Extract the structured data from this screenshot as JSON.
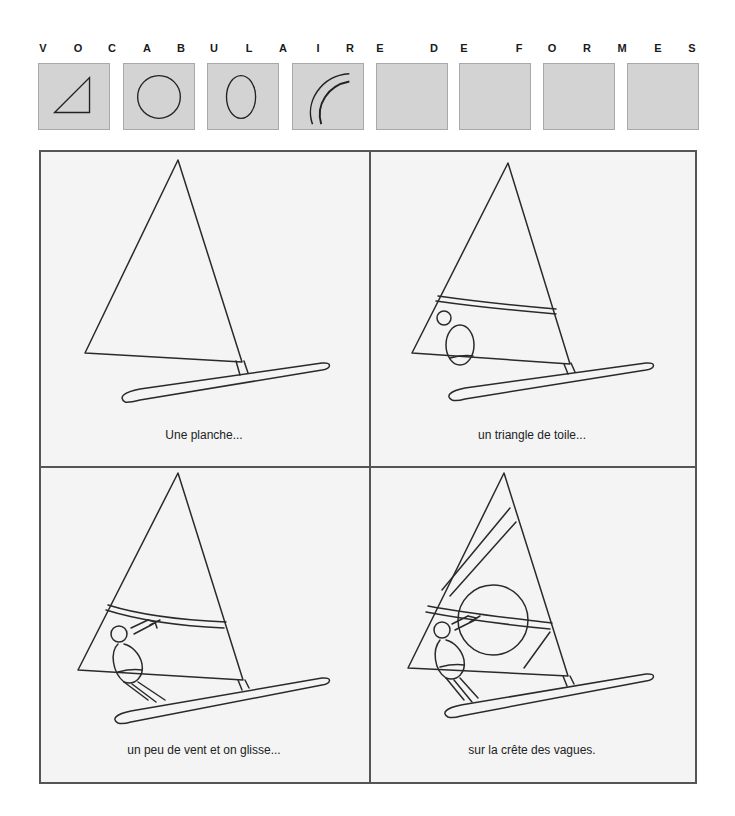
{
  "header": {
    "title_letters": [
      "V",
      "O",
      "C",
      "A",
      "B",
      "U",
      "L",
      "A",
      "I",
      "R",
      "E",
      "D",
      "E",
      "F",
      "O",
      "R",
      "M",
      "E",
      "S"
    ]
  },
  "shape_vocabulary": [
    {
      "icon": "triangle-icon",
      "label": "triangle"
    },
    {
      "icon": "circle-icon",
      "label": "circle"
    },
    {
      "icon": "oval-icon",
      "label": "oval"
    },
    {
      "icon": "double-arc-icon",
      "label": "arcs"
    },
    {
      "icon": "empty",
      "label": ""
    },
    {
      "icon": "empty",
      "label": ""
    },
    {
      "icon": "empty",
      "label": ""
    },
    {
      "icon": "empty",
      "label": ""
    }
  ],
  "colors": {
    "box_fill": "#d3d3d3",
    "panel_fill": "#f4f4f4",
    "border": "#555555",
    "stroke": "#2a2a2a"
  },
  "panels": [
    {
      "caption": "Une planche...",
      "illustration": "windsurf-board-and-sail"
    },
    {
      "caption": "un triangle de toile...",
      "illustration": "windsurf-with-boom-and-figure-outline"
    },
    {
      "caption": "un peu de vent et on glisse...",
      "illustration": "windsurfer-holding-boom"
    },
    {
      "caption": "sur la crête des vagues.",
      "illustration": "windsurfer-with-sail-pattern"
    }
  ]
}
